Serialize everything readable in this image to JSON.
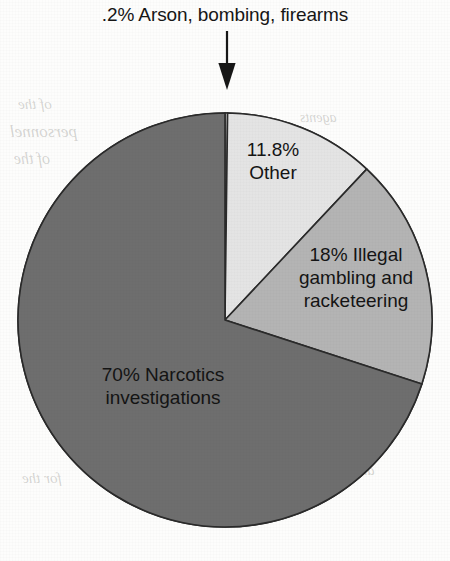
{
  "figure": {
    "name": "pie-chart-dea-investigations",
    "background_color": "#fdfdfc",
    "callout": {
      "title": ".2% Arson, bombing, firearms",
      "arrow_icon": "down-arrow-icon",
      "points_to_slice": "Arson, bombing, firearms"
    }
  },
  "labels": {
    "other": "11.8%\nOther",
    "gambling": "18% Illegal\ngambling and\nracketeering",
    "narcotics": "70% Narcotics\ninvestigations",
    "arson": ".2% Arson, bombing, firearms"
  },
  "bleedthrough": {
    "b1": "of the",
    "b2": "personnel",
    "b3": "of the",
    "b4": "for the",
    "b5": "and the",
    "b6": "agents"
  },
  "chart_data": {
    "type": "pie",
    "title": ".2% Arson, bombing, firearms",
    "subtitle": "",
    "xlabel": "",
    "ylabel": "",
    "unit": "percent",
    "start_angle_deg": 0,
    "direction": "clockwise",
    "grid": false,
    "legend": false,
    "legend_position": "none",
    "labels_inside_slices": true,
    "center_px": [
      225,
      320
    ],
    "radius_px": 207,
    "categories": [
      "Arson, bombing, firearms",
      "Other",
      "Illegal gambling and racketeering",
      "Narcotics investigations"
    ],
    "values": [
      0.2,
      11.8,
      18,
      70
    ],
    "value_labels": [
      ".2%",
      "11.8%",
      "18%",
      "70%"
    ],
    "slice_angles_deg": [
      0.72,
      42.48,
      64.8,
      252.0
    ],
    "colors": [
      "#e4e4e4",
      "#e4e4e4",
      "#b4b4b4",
      "#6e6e6e"
    ],
    "edge_color": "#2a2a2a",
    "edge_width_px": 1.6,
    "annotations": [
      {
        "text": ".2% Arson, bombing, firearms",
        "target": "Arson, bombing, firearms",
        "arrow": "down"
      }
    ]
  }
}
